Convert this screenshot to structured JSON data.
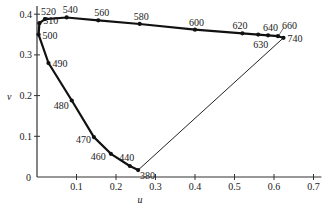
{
  "chart_data": {
    "type": "line",
    "title": "",
    "xlabel": "u",
    "ylabel": "v",
    "xlim": [
      0,
      0.72
    ],
    "ylim": [
      0,
      0.42
    ],
    "grid": false,
    "legend": null,
    "xticks": [
      {
        "value": 0.1,
        "label": "0.1"
      },
      {
        "value": 0.2,
        "label": "0.2"
      },
      {
        "value": 0.3,
        "label": "0.3"
      },
      {
        "value": 0.4,
        "label": "0.4"
      },
      {
        "value": 0.5,
        "label": "0.5"
      },
      {
        "value": 0.6,
        "label": "0.6"
      },
      {
        "value": 0.7,
        "label": "0.7"
      }
    ],
    "yticks": [
      {
        "value": 0.1,
        "label": "0.1"
      },
      {
        "value": 0.2,
        "label": "0.2"
      },
      {
        "value": 0.3,
        "label": "0.3"
      },
      {
        "value": 0.4,
        "label": "0.4"
      }
    ],
    "origin_label": "0",
    "series": [
      {
        "name": "spectral locus (wavelength, nm)",
        "points": [
          {
            "label": "380",
            "u": 0.256,
            "v": 0.017
          },
          {
            "label": "440",
            "u": 0.235,
            "v": 0.027
          },
          {
            "label": "460",
            "u": 0.187,
            "v": 0.057
          },
          {
            "label": "470",
            "u": 0.144,
            "v": 0.098
          },
          {
            "label": "480",
            "u": 0.088,
            "v": 0.188
          },
          {
            "label": "490",
            "u": 0.029,
            "v": 0.28
          },
          {
            "label": "500",
            "u": 0.004,
            "v": 0.35
          },
          {
            "label": "510",
            "u": 0.006,
            "v": 0.378
          },
          {
            "label": "520",
            "u": 0.02,
            "v": 0.388
          },
          {
            "label": "540",
            "u": 0.075,
            "v": 0.392
          },
          {
            "label": "560",
            "u": 0.155,
            "v": 0.385
          },
          {
            "label": "580",
            "u": 0.26,
            "v": 0.376
          },
          {
            "label": "600",
            "u": 0.4,
            "v": 0.362
          },
          {
            "label": "620",
            "u": 0.52,
            "v": 0.353
          },
          {
            "label": "630",
            "u": 0.56,
            "v": 0.35
          },
          {
            "label": "640",
            "u": 0.585,
            "v": 0.348
          },
          {
            "label": "660",
            "u": 0.61,
            "v": 0.346
          },
          {
            "label": "740",
            "u": 0.624,
            "v": 0.342
          }
        ]
      },
      {
        "name": "line of purples",
        "points": [
          {
            "u": 0.624,
            "v": 0.342
          },
          {
            "u": 0.256,
            "v": 0.017
          }
        ]
      }
    ]
  }
}
